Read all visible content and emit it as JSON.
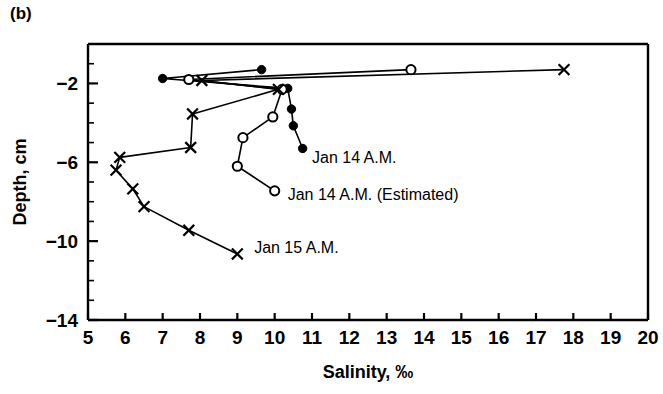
{
  "panel": {
    "label": "(b)"
  },
  "chart_data": {
    "type": "line",
    "title": "",
    "xlabel": "Salinity, ‰",
    "ylabel": "Depth, cm",
    "xlim": [
      5,
      20
    ],
    "ylim": [
      -14,
      0
    ],
    "xticks": [
      5,
      6,
      7,
      8,
      9,
      10,
      11,
      12,
      13,
      14,
      15,
      16,
      17,
      18,
      19,
      20
    ],
    "xtick_labels": [
      "5",
      "6",
      "7",
      "8",
      "9",
      "10",
      "11",
      "12",
      "13",
      "14",
      "15",
      "16",
      "17",
      "18",
      "19",
      "20"
    ],
    "yticks": [
      -2,
      -6,
      -10,
      -14
    ],
    "ytick_labels": [
      "−2",
      "−6",
      "−10",
      "−14"
    ],
    "yminor_step": 1,
    "grid": false,
    "legend_position": "inline-annotations",
    "orientation": "depth-profile",
    "series": [
      {
        "name": "Jan 14 A.M.",
        "marker": "filled-circle",
        "label_text": "Jan 14 A.M.",
        "label_x": 11.0,
        "label_y": -5.75,
        "points": [
          {
            "x": 9.65,
            "y": -1.3
          },
          {
            "x": 7.0,
            "y": -1.75
          },
          {
            "x": 10.35,
            "y": -2.25
          },
          {
            "x": 10.45,
            "y": -3.3
          },
          {
            "x": 10.5,
            "y": -4.15
          },
          {
            "x": 10.75,
            "y": -5.3
          }
        ]
      },
      {
        "name": "Jan 14 A.M. (Estimated)",
        "marker": "open-circle",
        "label_text": "Jan 14 A.M. (Estimated)",
        "label_x": 10.35,
        "label_y": -7.6,
        "points": [
          {
            "x": 13.65,
            "y": -1.3
          },
          {
            "x": 7.7,
            "y": -1.8
          },
          {
            "x": 10.2,
            "y": -2.3
          },
          {
            "x": 9.95,
            "y": -3.7
          },
          {
            "x": 9.15,
            "y": -4.75
          },
          {
            "x": 9.0,
            "y": -6.2
          },
          {
            "x": 10.0,
            "y": -7.45
          }
        ]
      },
      {
        "name": "Jan 15 A.M.",
        "marker": "cross-x",
        "label_text": "Jan 15 A.M.",
        "label_x": 9.45,
        "label_y": -10.3,
        "points": [
          {
            "x": 17.75,
            "y": -1.3
          },
          {
            "x": 8.05,
            "y": -1.85
          },
          {
            "x": 10.1,
            "y": -2.3
          },
          {
            "x": 7.8,
            "y": -3.55
          },
          {
            "x": 7.75,
            "y": -5.25
          },
          {
            "x": 5.85,
            "y": -5.75
          },
          {
            "x": 5.75,
            "y": -6.4
          },
          {
            "x": 6.2,
            "y": -7.35
          },
          {
            "x": 6.5,
            "y": -8.25
          },
          {
            "x": 7.7,
            "y": -9.45
          },
          {
            "x": 9.0,
            "y": -10.65
          }
        ]
      }
    ]
  }
}
